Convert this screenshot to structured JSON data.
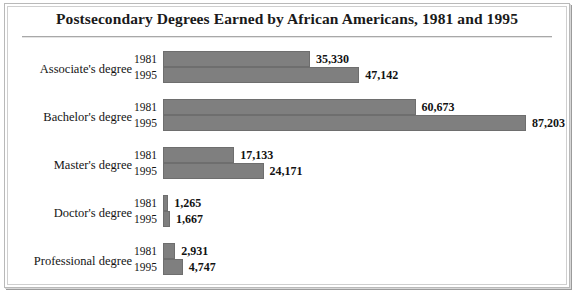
{
  "figure": {
    "title": "Postsecondary Degrees Earned by African Americans, 1981 and 1995",
    "bar_color": "#7f7f7f",
    "background_color": "#ffffff",
    "frame_color": "#b9b9b9"
  },
  "chart_data": {
    "type": "bar",
    "orientation": "horizontal",
    "title": "Postsecondary Degrees Earned by African Americans, 1981 and 1995",
    "xlabel": "",
    "ylabel": "",
    "grid": false,
    "legend": false,
    "categories": [
      "Associate's degree",
      "Bachelor's degree",
      "Master's degree",
      "Doctor's degree",
      "Professional degree"
    ],
    "series": [
      {
        "name": "1981",
        "values": [
          35330,
          60673,
          17133,
          1265,
          2931
        ],
        "labels": [
          "35,330",
          "60,673",
          "17,133",
          "1,265",
          "2,931"
        ]
      },
      {
        "name": "1995",
        "values": [
          47142,
          87203,
          24171,
          1667,
          4747
        ],
        "labels": [
          "47,142",
          "87,203",
          "24,171",
          "1,667",
          "4,747"
        ]
      }
    ],
    "xlim": [
      0,
      87203
    ],
    "max_value": 87203
  },
  "rows": [
    {
      "category": "Associate's degree",
      "bars": [
        {
          "year": "1981",
          "value": 35330,
          "label": "35,330"
        },
        {
          "year": "1995",
          "value": 47142,
          "label": "47,142"
        }
      ]
    },
    {
      "category": "Bachelor's degree",
      "bars": [
        {
          "year": "1981",
          "value": 60673,
          "label": "60,673"
        },
        {
          "year": "1995",
          "value": 87203,
          "label": "87,203"
        }
      ]
    },
    {
      "category": "Master's degree",
      "bars": [
        {
          "year": "1981",
          "value": 17133,
          "label": "17,133"
        },
        {
          "year": "1995",
          "value": 24171,
          "label": "24,171"
        }
      ]
    },
    {
      "category": "Doctor's degree",
      "bars": [
        {
          "year": "1981",
          "value": 1265,
          "label": "1,265"
        },
        {
          "year": "1995",
          "value": 1667,
          "label": "1,667"
        }
      ]
    },
    {
      "category": "Professional degree",
      "bars": [
        {
          "year": "1981",
          "value": 2931,
          "label": "2,931"
        },
        {
          "year": "1995",
          "value": 4747,
          "label": "4,747"
        }
      ]
    }
  ]
}
